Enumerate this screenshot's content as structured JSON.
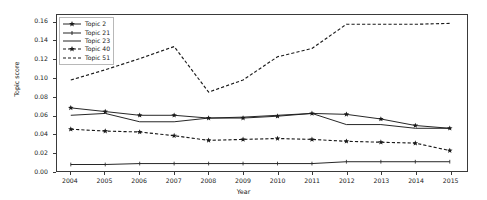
{
  "chart_data": {
    "type": "line",
    "title": "",
    "xlabel": "Year",
    "ylabel": "Topic score",
    "grid": false,
    "legend_position": "upper left",
    "x": [
      2004,
      2005,
      2006,
      2007,
      2008,
      2009,
      2010,
      2011,
      2012,
      2013,
      2014,
      2015
    ],
    "categories": [
      "2004",
      "2005",
      "2006",
      "2007",
      "2008",
      "2009",
      "2010",
      "2011",
      "2012",
      "2013",
      "2014",
      "2015"
    ],
    "xlim": [
      2003.6,
      2015.5
    ],
    "ylim": [
      0.0,
      0.168
    ],
    "yticks": [
      0.0,
      0.02,
      0.04,
      0.06,
      0.08,
      0.1,
      0.12,
      0.14,
      0.16
    ],
    "ytick_labels": [
      "0.00",
      "0.02",
      "0.04",
      "0.06",
      "0.08",
      "0.10",
      "0.12",
      "0.14",
      "0.16"
    ],
    "xticks": [
      2004,
      2005,
      2006,
      2007,
      2008,
      2009,
      2010,
      2011,
      2012,
      2013,
      2014,
      2015
    ],
    "xtick_labels": [
      "2004",
      "2005",
      "2006",
      "2007",
      "2008",
      "2009",
      "2010",
      "2011",
      "2012",
      "2013",
      "2014",
      "2015"
    ],
    "series": [
      {
        "name": "Topic 2",
        "style": "solid",
        "marker": "star",
        "color": "#1a1a1a",
        "values": [
          0.068,
          0.064,
          0.06,
          0.06,
          0.057,
          0.057,
          0.059,
          0.062,
          0.061,
          0.056,
          0.049,
          0.046
        ]
      },
      {
        "name": "Topic 21",
        "style": "solid",
        "marker": "tick",
        "color": "#1a1a1a",
        "values": [
          0.007,
          0.007,
          0.008,
          0.008,
          0.008,
          0.008,
          0.008,
          0.008,
          0.01,
          0.01,
          0.01,
          0.01
        ]
      },
      {
        "name": "Topic 23",
        "style": "solid",
        "marker": "none",
        "color": "#1a1a1a",
        "values": [
          0.06,
          0.062,
          0.053,
          0.053,
          0.057,
          0.058,
          0.06,
          0.062,
          0.05,
          0.05,
          0.046,
          0.046
        ]
      },
      {
        "name": "Topic 40",
        "style": "dashed",
        "marker": "star",
        "color": "#1a1a1a",
        "values": [
          0.045,
          0.043,
          0.042,
          0.038,
          0.033,
          0.034,
          0.035,
          0.034,
          0.032,
          0.031,
          0.03,
          0.022
        ]
      },
      {
        "name": "Topic 51",
        "style": "dashed",
        "marker": "none",
        "color": "#1a1a1a",
        "values": [
          0.098,
          0.109,
          0.121,
          0.134,
          0.085,
          0.098,
          0.123,
          0.132,
          0.158,
          0.158,
          0.158,
          0.159
        ]
      }
    ]
  },
  "legend": {
    "items": [
      {
        "label": "Topic 2"
      },
      {
        "label": "Topic 21"
      },
      {
        "label": "Topic 23"
      },
      {
        "label": "Topic 40"
      },
      {
        "label": "Topic 51"
      }
    ]
  },
  "axes": {
    "x_title": "Year",
    "y_title": "Topic score"
  }
}
